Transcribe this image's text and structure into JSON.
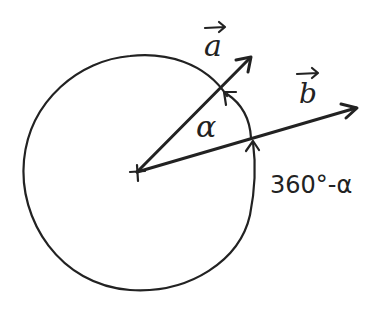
{
  "diagram": {
    "kind": "angle-between-vectors",
    "colors": {
      "ink": "#222222",
      "background": "#ffffff"
    },
    "vectors": [
      {
        "id": "a",
        "label": "a",
        "arrow_glyph": "→"
      },
      {
        "id": "b",
        "label": "b",
        "arrow_glyph": "→"
      }
    ],
    "angles": {
      "inner": {
        "label": "α"
      },
      "outer": {
        "label": "360°-α"
      }
    },
    "origin_marker": "plus"
  }
}
